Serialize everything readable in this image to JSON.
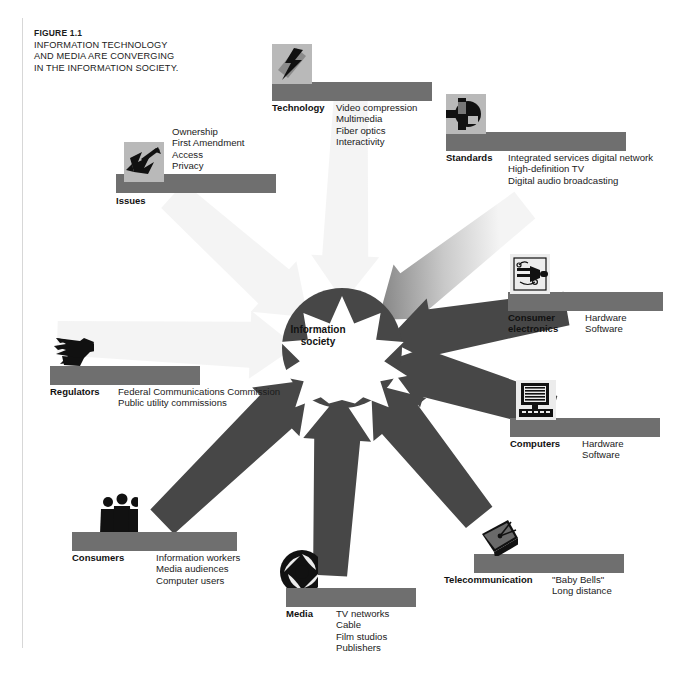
{
  "caption": {
    "figure_number": "FIGURE 1.1",
    "lines": [
      "INFORMATION TECHNOLOGY",
      "AND MEDIA ARE CONVERGING",
      "IN THE INFORMATION SOCIETY."
    ]
  },
  "center": {
    "label_line1": "Information",
    "label_line2": "society",
    "shape": "ten-point-starburst",
    "fill": "#ffffff",
    "hub_fill": "#3f3f3f"
  },
  "colors": {
    "bar": "#6f6f6f",
    "tile": "#b9b9b9",
    "icon": "#1a1a1a",
    "arrow_outer": "#f2f2f2",
    "arrow_inner": "#4a4a4a",
    "text": "#1b1b1b"
  },
  "nodes": [
    {
      "id": "technology",
      "name": "Technology",
      "icon": "lightning-bolt-icon",
      "items": [
        "Video compression",
        "Multimedia",
        "Fiber optics",
        "Interactivity"
      ]
    },
    {
      "id": "standards",
      "name": "Standards",
      "icon": "crosshair-circle-icon",
      "items": [
        "Integrated services digital network",
        "High-definition TV",
        "Digital audio broadcasting"
      ]
    },
    {
      "id": "issues",
      "name": "Issues",
      "icon": "arrows-scatter-icon",
      "items": [
        "Ownership",
        "First Amendment",
        "Access",
        "Privacy"
      ]
    },
    {
      "id": "consumer-electronics",
      "name_line1": "Consumer",
      "name_line2": "electronics",
      "name": "Consumer electronics",
      "icon": "circuit-plug-icon",
      "items": [
        "Hardware",
        "Software"
      ]
    },
    {
      "id": "computers",
      "name": "Computers",
      "icon": "desktop-computer-icon",
      "items": [
        "Hardware",
        "Software"
      ]
    },
    {
      "id": "regulators",
      "name": "Regulators",
      "icon": "eagle-icon",
      "items": [
        "Federal Communications Commission",
        "Public utility commissions"
      ]
    },
    {
      "id": "consumers",
      "name": "Consumers",
      "icon": "people-group-icon",
      "items": [
        "Information workers",
        "Media audiences",
        "Computer users"
      ]
    },
    {
      "id": "media",
      "name": "Media",
      "icon": "camera-aperture-icon",
      "items": [
        "TV networks",
        "Cable",
        "Film studios",
        "Publishers"
      ]
    },
    {
      "id": "telecommunication",
      "name": "Telecommunication",
      "icon": "satellite-dish-icon",
      "items": [
        "\"Baby Bells\"",
        "Long distance"
      ]
    }
  ]
}
